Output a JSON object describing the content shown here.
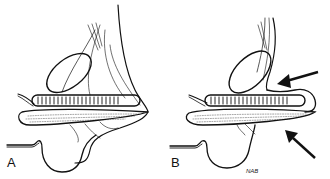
{
  "figure": {
    "panels": [
      {
        "label": "A"
      },
      {
        "label": "B"
      }
    ],
    "signature": "NAB",
    "colors": {
      "ink": "#111111",
      "background": "#ffffff"
    }
  }
}
